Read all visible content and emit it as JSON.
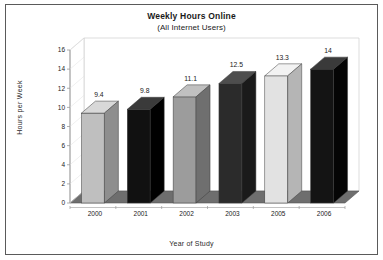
{
  "chart_data": {
    "type": "bar",
    "title": "Weekly Hours Online",
    "subtitle": "(All Internet Users)",
    "xlabel": "Year of Study",
    "ylabel": "Hours per Week",
    "categories": [
      "2000",
      "2001",
      "2002",
      "2003",
      "2005",
      "2006"
    ],
    "values": [
      9.4,
      9.8,
      11.1,
      12.5,
      13.3,
      14
    ],
    "value_labels": [
      "9.4",
      "9.8",
      "11.1",
      "12.5",
      "13.3",
      "14"
    ],
    "ylim": [
      0,
      16
    ],
    "ytick_labels": [
      "0",
      "2",
      "4",
      "6",
      "8",
      "10",
      "12",
      "14",
      "16"
    ],
    "ytick_values": [
      0,
      2,
      4,
      6,
      8,
      10,
      12,
      14,
      16
    ],
    "grid": false,
    "legend": "none",
    "three_d": true,
    "bar_colors": [
      "#bfbfbf",
      "#111111",
      "#9c9c9c",
      "#2b2b2b",
      "#e2e2e2",
      "#141414"
    ],
    "bar_top_colors": [
      "#d8d8d8",
      "#3a3a3a",
      "#c0c0c0",
      "#4e4e4e",
      "#f2f2f2",
      "#3a3a3a"
    ],
    "bar_side_colors": [
      "#8e8e8e",
      "#000000",
      "#6f6f6f",
      "#1a1a1a",
      "#b5b5b5",
      "#050505"
    ],
    "floor_color": "#6e6e6e",
    "wall_color": "#ffffff",
    "frame_color": "#5a5a5a",
    "axis_color": "#9a9a9a"
  }
}
